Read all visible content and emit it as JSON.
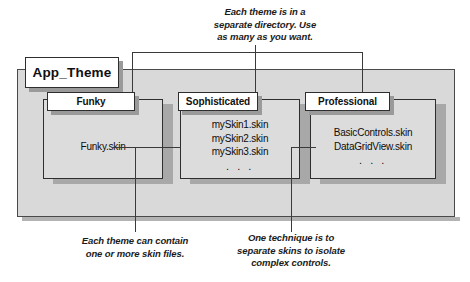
{
  "diagram": {
    "root": {
      "label": "App_Theme"
    },
    "folders": [
      {
        "name": "funky",
        "label": "Funky",
        "files": [
          "Funky.skin"
        ],
        "ellipsis": ""
      },
      {
        "name": "sophisticated",
        "label": "Sophisticated",
        "files": [
          "mySkin1.skin",
          "mySkin2.skin",
          "mySkin3.skin"
        ],
        "ellipsis": ". . ."
      },
      {
        "name": "professional",
        "label": "Professional",
        "files": [
          "BasicControls.skin",
          "DataGridView.skin"
        ],
        "ellipsis": ". . ."
      }
    ],
    "captions": {
      "top": {
        "name": "caption-themes-directory",
        "lines": [
          "Each theme is in a",
          "separate directory. Use",
          "as many as you want."
        ]
      },
      "bottom_left": {
        "name": "caption-skin-files",
        "lines": [
          "Each theme can contain",
          "one or more skin files."
        ]
      },
      "bottom_right": {
        "name": "caption-separate-skins",
        "lines": [
          "One technique is to",
          "separate skins to isolate",
          "complex controls."
        ]
      }
    },
    "colors": {
      "outer_fill": "#d9d9d9",
      "folder_fill": "#dcdcdc",
      "tab_fill": "#ffffff",
      "border": "#2e2e2e",
      "shadow": "#a8a8a8",
      "text": "#101010"
    }
  }
}
